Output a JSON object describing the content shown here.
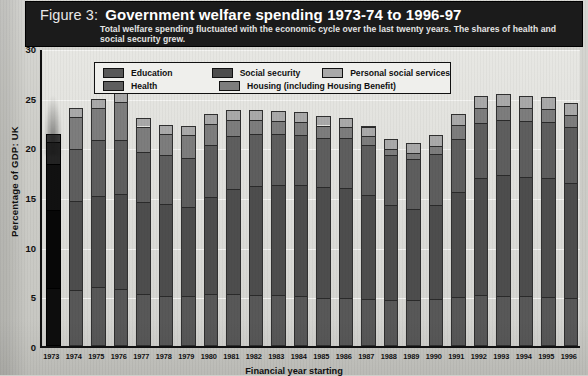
{
  "figure": {
    "label": "Figure 3:",
    "title": "Government welfare spending 1973-74 to 1996-97",
    "subtitle": "Total welfare spending fluctuated with the economic cycle over the last twenty years. The shares of health and social security grew."
  },
  "legend": {
    "items": [
      {
        "label": "Education",
        "color": "#585858"
      },
      {
        "label": "Social security",
        "color": "#4d4d4d"
      },
      {
        "label": "Personal social services",
        "color": "#a9a9a9"
      },
      {
        "label": "Health",
        "color": "#5e5e5e"
      },
      {
        "label": "Housing (including Housing Benefit)",
        "color": "#7d7d7d"
      }
    ]
  },
  "axes": {
    "y_title": "Percentage of GDP: UK",
    "y_ticks": [
      "0",
      "5",
      "10",
      "15",
      "20",
      "25",
      "30"
    ],
    "x_title": "Financial year starting"
  },
  "chart_data": {
    "type": "bar",
    "title": "Government welfare spending 1973-74 to 1996-97",
    "subtitle": "Total welfare spending fluctuated with the economic cycle over the last twenty years. The shares of health and social security grew.",
    "xlabel": "Financial year starting",
    "ylabel": "Percentage of GDP: UK",
    "ylim": [
      0,
      30
    ],
    "ytick_step": 5,
    "grid": true,
    "stacked": true,
    "legend_position": "top-inside",
    "categories": [
      "1973",
      "1974",
      "1975",
      "1976",
      "1977",
      "1978",
      "1979",
      "1980",
      "1981",
      "1982",
      "1983",
      "1984",
      "1985",
      "1986",
      "1987",
      "1988",
      "1989",
      "1990",
      "1991",
      "1992",
      "1993",
      "1994",
      "1995",
      "1996"
    ],
    "series": [
      {
        "name": "Education",
        "color": "#585858",
        "values": [
          5.8,
          5.6,
          5.9,
          5.7,
          5.2,
          5.0,
          5.0,
          5.2,
          5.2,
          5.1,
          5.1,
          5.0,
          4.8,
          4.8,
          4.7,
          4.6,
          4.6,
          4.7,
          4.9,
          5.1,
          5.0,
          5.0,
          4.9,
          4.8
        ]
      },
      {
        "name": "Social security",
        "color": "#4d4d4d",
        "values": [
          7.9,
          9.0,
          9.2,
          9.6,
          9.3,
          9.3,
          9.0,
          9.8,
          10.6,
          11.0,
          11.1,
          11.2,
          11.2,
          11.1,
          10.5,
          9.6,
          9.2,
          9.5,
          10.6,
          11.8,
          12.2,
          12.0,
          12.0,
          11.6
        ]
      },
      {
        "name": "Health",
        "color": "#5e5e5e",
        "values": [
          4.6,
          5.2,
          5.6,
          5.4,
          5.0,
          4.9,
          4.9,
          5.2,
          5.3,
          5.2,
          5.1,
          5.0,
          4.9,
          5.0,
          5.0,
          5.0,
          5.0,
          5.1,
          5.3,
          5.6,
          5.6,
          5.7,
          5.7,
          5.6
        ]
      },
      {
        "name": "Housing (including Housing Benefit)",
        "color": "#7d7d7d",
        "values": [
          2.2,
          3.3,
          3.3,
          3.9,
          2.6,
          2.1,
          2.3,
          2.2,
          1.7,
          1.5,
          1.4,
          1.4,
          1.3,
          1.1,
          0.9,
          0.6,
          0.6,
          0.8,
          1.4,
          1.5,
          1.4,
          1.3,
          1.3,
          1.3
        ]
      },
      {
        "name": "Personal social services",
        "color": "#a9a9a9",
        "values": [
          0.8,
          0.9,
          0.9,
          0.9,
          0.9,
          0.9,
          0.9,
          1.0,
          1.0,
          1.0,
          1.0,
          1.0,
          1.0,
          1.0,
          1.0,
          1.0,
          1.0,
          1.1,
          1.2,
          1.2,
          1.2,
          1.2,
          1.2,
          1.2
        ]
      }
    ],
    "totals": [
      21.3,
      24.0,
      24.9,
      25.5,
      23.0,
      22.2,
      22.1,
      23.4,
      23.8,
      23.8,
      23.7,
      23.6,
      23.2,
      23.0,
      22.1,
      20.8,
      20.4,
      21.2,
      23.4,
      25.2,
      25.4,
      25.2,
      25.1,
      24.5
    ]
  }
}
